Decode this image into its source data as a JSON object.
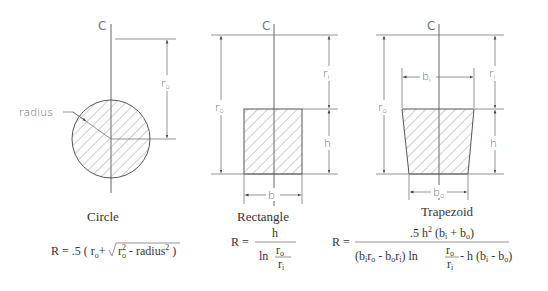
{
  "centerline_label": "C",
  "shapes": [
    {
      "name": "Circle",
      "caption": "Circle",
      "labels": {
        "outer_radius": "r",
        "outer_radius_sub": "o",
        "radius": "radius"
      },
      "formula": {
        "lhs": "R = .5 (",
        "r": "r",
        "r_sub": "o",
        "plus": "+",
        "sqrt_r": "r",
        "sqrt_r_sub": "o",
        "sqrt_r_sup": "2",
        "minus_radius": " - radius",
        "radius_sup": "2",
        "close": ")"
      }
    },
    {
      "name": "Rectangle",
      "caption": "Rectangle",
      "labels": {
        "outer_radius": "r",
        "outer_radius_sub": "o",
        "inner_radius": "r",
        "inner_radius_sub": "i",
        "height": "h",
        "base": "b"
      },
      "formula": {
        "lhs": "R =",
        "numerator": "h",
        "ln": "ln",
        "frac_num": "r",
        "frac_num_sub": "o",
        "frac_den": "r",
        "frac_den_sub": "i"
      }
    },
    {
      "name": "Trapezoid",
      "caption": "Trapezoid",
      "labels": {
        "outer_radius": "r",
        "outer_radius_sub": "o",
        "inner_radius": "r",
        "inner_radius_sub": "i",
        "height": "h",
        "top_base": "b",
        "top_base_sub": "i",
        "bottom_base": "b",
        "bottom_base_sub": "o"
      },
      "formula": {
        "lhs": "R =",
        "numerator_a": ".5 h",
        "numerator_sup": "2",
        "numerator_b": " (b",
        "numerator_b_sub": "i",
        "numerator_c": " + b",
        "numerator_c_sub": "o",
        "numerator_d": ")",
        "den_1": "(b",
        "den_1_sub": "i",
        "den_2": "r",
        "den_2_sub": "o",
        "den_3": " - b",
        "den_3_sub": "o",
        "den_4": "r",
        "den_4_sub": "i",
        "den_5": ") ln",
        "den_frac_num": "r",
        "den_frac_num_sub": "o",
        "den_frac_den": "r",
        "den_frac_den_sub": "i",
        "den_6": " - h (b",
        "den_6_sub": "i",
        "den_7": " - b",
        "den_7_sub": "o",
        "den_8": ")"
      }
    }
  ]
}
